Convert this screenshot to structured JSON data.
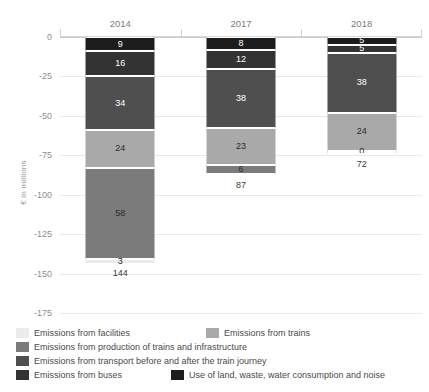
{
  "chart_data": {
    "type": "bar",
    "title": "",
    "subtitle": "",
    "xlabel": "",
    "ylabel": "€ in millions",
    "stacked": true,
    "orientation": "vertical-negative",
    "grid": true,
    "legend_position": "bottom",
    "ylim": [
      -175,
      0
    ],
    "yticks": [
      "0",
      "-25",
      "-50",
      "-75",
      "-100",
      "-125",
      "-150",
      "-175"
    ],
    "ytick_values": [
      0,
      -25,
      -50,
      -75,
      -100,
      -125,
      -150,
      -175
    ],
    "categories": [
      "2014",
      "2017",
      "2018"
    ],
    "series": [
      {
        "name": "Use of land, waste, water consumption and noise",
        "color": "#1d1d1d",
        "values": [
          9,
          8,
          5
        ],
        "labels": [
          "9",
          "8",
          "5"
        ]
      },
      {
        "name": "Emissions from buses",
        "color": "#333333",
        "values": [
          16,
          12,
          5
        ],
        "labels": [
          "16",
          "12",
          "5"
        ]
      },
      {
        "name": "Emissions from transport before and after the train journey",
        "color": "#4f4f4f",
        "values": [
          34,
          38,
          38
        ],
        "labels": [
          "34",
          "38",
          "38"
        ]
      },
      {
        "name": "Emissions from trains",
        "color": "#a9a9a9",
        "values": [
          24,
          23,
          24
        ],
        "labels": [
          "24",
          "23",
          "24"
        ]
      },
      {
        "name": "Emissions from production of trains and infrastructure",
        "color": "#7b7b7b",
        "values": [
          58,
          6,
          0
        ],
        "labels": [
          "58",
          "6",
          "0"
        ]
      },
      {
        "name": "Emissions from facilities",
        "color": "#ececec",
        "values": [
          3,
          0,
          0
        ],
        "labels": [
          "3",
          "",
          ""
        ]
      }
    ],
    "totals": [
      144,
      87,
      72
    ],
    "total_labels": [
      "144",
      "87",
      "72"
    ]
  },
  "legend": {
    "rows": [
      [
        {
          "label": "Emissions from facilities",
          "color": "#ececec"
        },
        {
          "label": "Emissions from trains",
          "color": "#a9a9a9"
        }
      ],
      [
        {
          "label": "Emissions from production of trains and infrastructure",
          "color": "#7b7b7b"
        }
      ],
      [
        {
          "label": "Emissions from transport before and after the train journey",
          "color": "#4f4f4f"
        }
      ],
      [
        {
          "label": "Emissions from buses",
          "color": "#333333"
        },
        {
          "label": "Use of land, waste, water consumption and noise",
          "color": "#1d1d1d"
        }
      ]
    ]
  }
}
